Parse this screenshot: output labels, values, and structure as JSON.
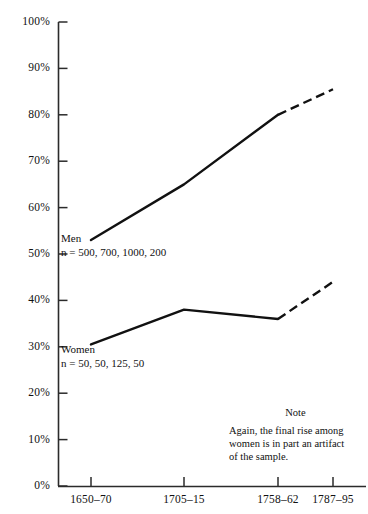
{
  "chart_data": {
    "type": "line",
    "title": "",
    "xlabel": "",
    "ylabel": "",
    "ylim": [
      0,
      100
    ],
    "grid": false,
    "legend_position": "inline-labels",
    "categories": [
      "1650–70",
      "1705–15",
      "1758–62",
      "1787–95"
    ],
    "x_positions_px": [
      91,
      184,
      278,
      333
    ],
    "y_ticks": [
      "0%",
      "10%",
      "20%",
      "30%",
      "40%",
      "50%",
      "60%",
      "70%",
      "80%",
      "90%",
      "100%"
    ],
    "y_tick_values": [
      0,
      10,
      20,
      30,
      40,
      50,
      60,
      70,
      80,
      90,
      100
    ],
    "series": [
      {
        "name": "Men",
        "values": [
          53,
          65,
          80,
          85.5
        ],
        "solid_through_index": 2,
        "dashed_tail": true,
        "sample_sizes": [
          500,
          700,
          1000,
          200
        ],
        "label": "Men",
        "n_label": "n = 500, 700, 1000, 200"
      },
      {
        "name": "Women",
        "values": [
          30.5,
          38,
          36,
          44
        ],
        "solid_through_index": 2,
        "dashed_tail": true,
        "sample_sizes": [
          50,
          50,
          125,
          50
        ],
        "label": "Women",
        "n_label": "n = 50, 50, 125, 50"
      }
    ],
    "annotations": [
      {
        "title": "Note",
        "text": "Again, the final rise among women is in part an artifact of the sample."
      }
    ]
  },
  "axis": {
    "line_color": "#2b2b2b",
    "series_color": "#111111"
  },
  "note": {
    "title": "Note",
    "line1": "Again, the final rise among",
    "line2": "women is in part an artifact",
    "line3": "of the sample."
  },
  "series_labels": {
    "men_name": "Men",
    "men_n": "n = 500, 700, 1000, 200",
    "women_name": "Women",
    "women_n": "n = 50, 50, 125, 50"
  },
  "y_tick_labels": [
    "100%",
    "90%",
    "80%",
    "70%",
    "60%",
    "50%",
    "40%",
    "30%",
    "20%",
    "10%",
    "0%"
  ],
  "x_tick_labels": [
    "1650–70",
    "1705–15",
    "1758–62",
    "1787–95"
  ]
}
